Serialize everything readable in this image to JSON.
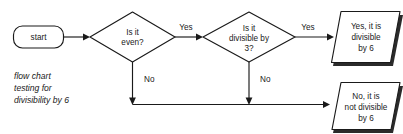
{
  "diagram": {
    "title": "flow chart testing for divisibility by 6",
    "caption": {
      "line1": "flow chart",
      "line2": "testing for",
      "line3": "divisibility by 6"
    },
    "colors": {
      "stroke": "#1a1a1a",
      "fill": "#ffffff",
      "shadow": "#2b2b2b",
      "background": "#ffffff"
    },
    "nodes": {
      "start": {
        "shape": "rounded-rectangle",
        "label": "start"
      },
      "decision_even": {
        "shape": "diamond",
        "line1": "Is it",
        "line2": "even?"
      },
      "decision_div3": {
        "shape": "diamond",
        "line1": "Is it",
        "line2": "divisible by",
        "line3": "3?"
      },
      "result_yes": {
        "shape": "parallelogram",
        "line1": "Yes, it is",
        "line2": "divisible",
        "line3": "by 6"
      },
      "result_no": {
        "shape": "parallelogram",
        "line1": "No, it is",
        "line2": "not divisible",
        "line3": "by 6"
      }
    },
    "edges": {
      "even_yes": "Yes",
      "even_no": "No",
      "div3_yes": "Yes",
      "div3_no": "No"
    }
  }
}
